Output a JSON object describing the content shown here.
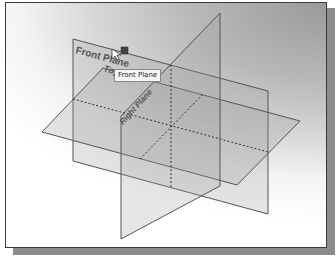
{
  "scene": {
    "planes": [
      {
        "name": "Front Plane",
        "label": "Front Plane"
      },
      {
        "name": "Top Plane",
        "label": "Top Plane"
      },
      {
        "name": "Right Plane",
        "label": "Right Plane"
      }
    ],
    "tooltip": "Front Plane",
    "colors": {
      "plane_edge": "#555555",
      "plane_fill": "#9a9a9a",
      "label": "#555555",
      "handle": "#444444"
    }
  }
}
